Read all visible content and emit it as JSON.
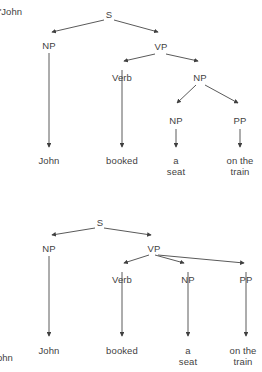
{
  "figure": {
    "background_color": "#ffffff",
    "ink_color": "#3f3f3f",
    "line_color": "#4a4a4a",
    "sentence": "John booked a seat on the train",
    "edge_fragments": {
      "top_left": "\"John",
      "bottom_left": "ohn"
    }
  },
  "trees": [
    {
      "id": "tree-top",
      "name": "parse-tree-1",
      "nodes": {
        "s": "S",
        "np_subject": "NP",
        "vp": "VP",
        "verb": "Verb",
        "np_object": "NP",
        "np_inner": "NP",
        "pp": "PP"
      },
      "leaves": {
        "john": "John",
        "booked": "booked",
        "a": "a",
        "seat": "seat",
        "on_the": "on the",
        "train": "train"
      }
    },
    {
      "id": "tree-bottom",
      "name": "parse-tree-2",
      "nodes": {
        "s": "S",
        "np_subject": "NP",
        "vp": "VP",
        "verb": "Verb",
        "np_object": "NP",
        "pp": "PP"
      },
      "leaves": {
        "john": "John",
        "booked": "booked",
        "a": "a",
        "seat": "seat",
        "on_the": "on the",
        "train": "train"
      }
    }
  ]
}
